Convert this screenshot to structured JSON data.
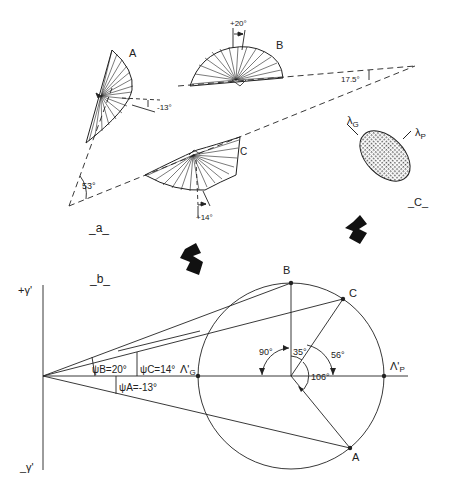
{
  "panel_a": {
    "label": "_a_",
    "crystals": [
      {
        "id": "A",
        "label": "A",
        "angle_label": "-13°"
      },
      {
        "id": "B",
        "label": "B",
        "angle_label": "+20°"
      },
      {
        "id": "C",
        "label": "C",
        "angle_label": "+14°"
      }
    ],
    "apex_angle_left": "53°",
    "apex_angle_right": "17.5°"
  },
  "panel_c": {
    "label": "_C_",
    "lambda_g": "λ",
    "lambda_g_sub": "G",
    "lambda_p": "λ",
    "lambda_p_sub": "P"
  },
  "panel_b": {
    "label": "_b_",
    "axis_top": "+γ'",
    "axis_bottom": "_γ'",
    "psi_b": "ψB=20°",
    "psi_c": "ψC=14°",
    "psi_a": "ψA=-13°",
    "lambda_g": "Λ'",
    "lambda_g_sub": "G",
    "lambda_p": "Λ'",
    "lambda_p_sub": "P",
    "point_b": "B",
    "point_c": "C",
    "point_a": "A",
    "angle_90": "90°",
    "angle_35": "35°",
    "angle_56": "56°",
    "angle_106": "106°"
  },
  "colors": {
    "ink": "#222222",
    "background": "#ffffff",
    "ellipse_fill": "#bdbdbd"
  }
}
